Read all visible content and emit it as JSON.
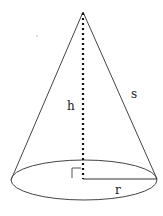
{
  "diagram": {
    "labels": {
      "height": "h",
      "slant": "s",
      "radius": "r"
    },
    "colors": {
      "stroke": "#333333",
      "background": "#ffffff"
    }
  }
}
